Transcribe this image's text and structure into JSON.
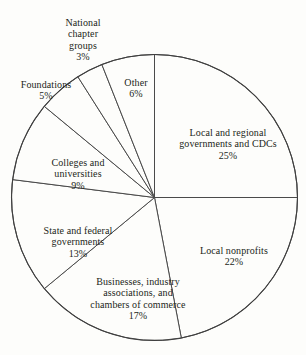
{
  "chart_data": {
    "type": "pie",
    "title": "",
    "subtitle": "",
    "xlabel": "",
    "ylabel": "",
    "legend_position": "none",
    "grid": false,
    "units": "percent",
    "total": 100,
    "start_angle_deg": 0,
    "direction": "clockwise",
    "categories": [
      "Local and regional governments and CDCs",
      "Local nonprofits",
      "Businesses, industry associations, and chambers of commerce",
      "State and federal governments",
      "Colleges and universities",
      "Foundations",
      "National chapter groups",
      "Other"
    ],
    "values": [
      25,
      22,
      17,
      13,
      9,
      5,
      3,
      6
    ],
    "slices": [
      {
        "label": "Local and regional\ngovernments and CDCs",
        "value": 25,
        "percent_text": "25%",
        "color": "#fdfdfb",
        "stroke": "#4a4a4a"
      },
      {
        "label": "Local nonprofits",
        "value": 22,
        "percent_text": "22%",
        "color": "#fdfdfb",
        "stroke": "#4a4a4a"
      },
      {
        "label": "Businesses, industry\nassociations, and\nchambers of commerce",
        "value": 17,
        "percent_text": "17%",
        "color": "#fdfdfb",
        "stroke": "#4a4a4a"
      },
      {
        "label": "State and federal\ngovernments",
        "value": 13,
        "percent_text": "13%",
        "color": "#fdfdfb",
        "stroke": "#4a4a4a"
      },
      {
        "label": "Colleges and\nuniversities",
        "value": 9,
        "percent_text": "9%",
        "color": "#fdfdfb",
        "stroke": "#4a4a4a"
      },
      {
        "label": "Foundations",
        "value": 5,
        "percent_text": "5%",
        "color": "#fdfdfb",
        "stroke": "#4a4a4a"
      },
      {
        "label": "National\nchapter\ngroups",
        "value": 3,
        "percent_text": "3%",
        "color": "#fdfdfb",
        "stroke": "#4a4a4a"
      },
      {
        "label": "Other",
        "value": 6,
        "percent_text": "6%",
        "color": "#fdfdfb",
        "stroke": "#4a4a4a"
      }
    ]
  },
  "labels": {
    "national_chapter_groups": "National\nchapter\ngroups",
    "national_chapter_groups_pct": "3%",
    "foundations": "Foundations",
    "foundations_pct": "5%",
    "colleges": "Colleges and\nuniversities",
    "colleges_pct": "9%",
    "state_federal": "State and federal\ngovernments",
    "state_federal_pct": "13%",
    "businesses": "Businesses, industry\nassociations, and\nchambers of commerce",
    "businesses_pct": "17%",
    "other": "Other",
    "other_pct": "6%",
    "local_regional": "Local and regional\ngovernments and CDCs",
    "local_regional_pct": "25%",
    "local_nonprofits": "Local nonprofits",
    "local_nonprofits_pct": "22%"
  }
}
